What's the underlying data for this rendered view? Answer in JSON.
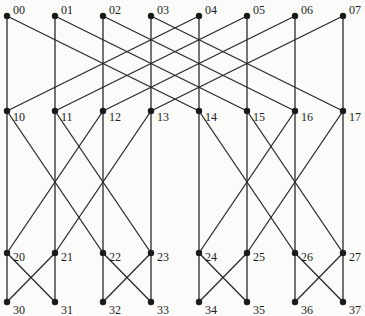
{
  "diagram": {
    "type": "butterfly-network",
    "levels": 4,
    "nodes_per_level": 8,
    "column_x": [
      7,
      55,
      103,
      151,
      199,
      247,
      295,
      343
    ],
    "row_y": [
      16,
      111,
      253,
      302
    ],
    "label_offsets": [
      {
        "dx": 6,
        "dy": -6
      },
      {
        "dx": 6,
        "dy": 6
      },
      {
        "dx": 6,
        "dy": 4
      },
      {
        "dx": 6,
        "dy": 8
      }
    ],
    "stage_distances": [
      4,
      2,
      1
    ],
    "labels": [
      [
        "00",
        "01",
        "02",
        "03",
        "04",
        "05",
        "06",
        "07"
      ],
      [
        "10",
        "11",
        "12",
        "13",
        "14",
        "15",
        "16",
        "17"
      ],
      [
        "20",
        "21",
        "22",
        "23",
        "24",
        "25",
        "26",
        "27"
      ],
      [
        "30",
        "31",
        "32",
        "33",
        "34",
        "35",
        "36",
        "37"
      ]
    ],
    "colors": {
      "edge": "#2a2a2a",
      "node": "#1a1a1a",
      "text": "#222222",
      "background": "#fbfbf9"
    }
  }
}
